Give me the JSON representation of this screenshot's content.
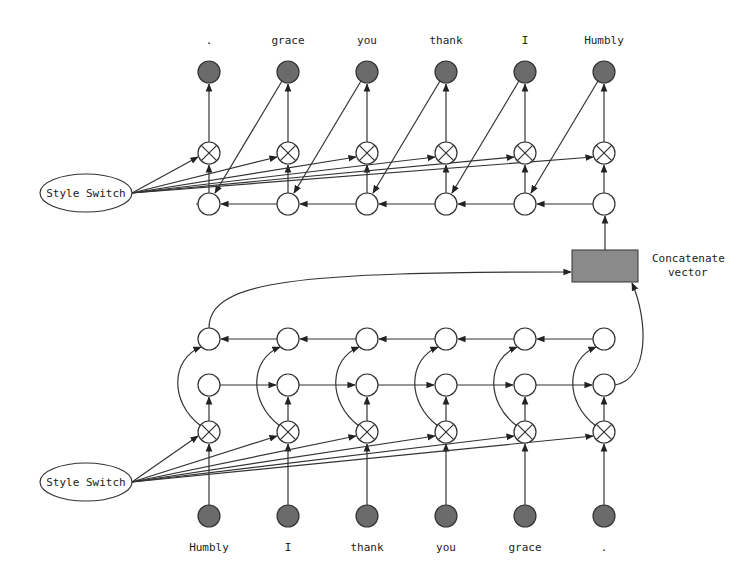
{
  "diagram": {
    "type": "seq2seq-style-transfer",
    "columns_x": [
      209,
      288,
      367,
      446,
      525,
      604
    ],
    "decoder": {
      "output_tokens": [
        ".",
        "grace",
        "you",
        "thank",
        "I",
        "Humbly"
      ],
      "style_switch_label": "Style Switch"
    },
    "encoder": {
      "input_tokens": [
        "Humbly",
        "I",
        "thank",
        "you",
        "grace",
        "."
      ],
      "style_switch_label": "Style Switch"
    },
    "concat": {
      "label_line1": "Concatenate",
      "label_line2": "vector"
    },
    "colors": {
      "token_fill": "#6b6b6b",
      "concat_fill": "#8a8a8a",
      "node_stroke": "#333333",
      "background": "#ffffff"
    }
  }
}
